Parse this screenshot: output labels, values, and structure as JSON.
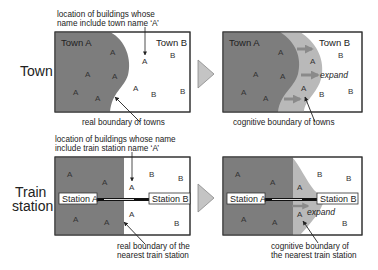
{
  "colors": {
    "dark_region": "#7d7d7d",
    "light_region": "#b9b9b9",
    "border": "#333333",
    "arrow_fill": "#c4c4c4",
    "expand_arrow": "#8a8a8a",
    "rail": "#111111"
  },
  "rows": [
    {
      "label": "Town",
      "left_panel": {
        "top_note_line1": "location of buildings whose",
        "top_note_line2": "name include town name ‘A’",
        "region_a_label": "Town A",
        "region_b_label": "Town B",
        "caption": "real boundary of towns"
      },
      "right_panel": {
        "region_a_label": "Town A",
        "region_b_label": "Town B",
        "expand_label": "expand",
        "caption": "cognitive boundary of towns"
      }
    },
    {
      "label_line1": "Train",
      "label_line2": "station",
      "left_panel": {
        "top_note_line1": "location of buildings whose name",
        "top_note_line2": "include train station name ‘A’",
        "station_a_label": "Station A",
        "station_b_label": "Station B",
        "caption_line1": "real boundary of the",
        "caption_line2": "nearest train station"
      },
      "right_panel": {
        "station_a_label": "Station A",
        "station_b_label": "Station B",
        "expand_label": "expand",
        "caption_line1": "cognitive boundary of",
        "caption_line2": "the nearest train station"
      }
    }
  ],
  "letters": {
    "a": "A",
    "b": "B"
  },
  "transition_icon": "right-triangle-arrow"
}
